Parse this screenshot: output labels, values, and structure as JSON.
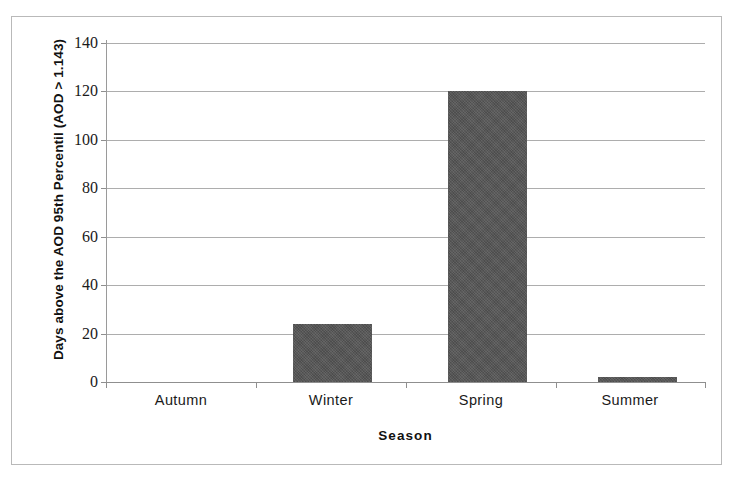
{
  "chart_data": {
    "type": "bar",
    "title": "",
    "subtitle": "",
    "xlabel": "Season",
    "ylabel": "Days above the AOD 95th Percentil (AOD > 1.143)",
    "categories": [
      "Autumn",
      "Winter",
      "Spring",
      "Summer"
    ],
    "values": [
      0,
      24,
      120,
      2
    ],
    "series": [
      {
        "name": "Days above the AOD 95th percentile",
        "values": [
          0,
          24,
          120,
          2
        ]
      }
    ],
    "ylim": [
      0,
      140
    ],
    "ytick_values": [
      0,
      20,
      40,
      60,
      80,
      100,
      120,
      140
    ],
    "ytick_labels": [
      "0",
      "20",
      "40",
      "60",
      "80",
      "100",
      "120",
      "140"
    ],
    "xtick_labels": [
      "Autumn",
      "Winter",
      "Spring",
      "Summer"
    ],
    "grid": true,
    "grid_axis": "y",
    "legend": false,
    "legend_position": "none",
    "bar_color": "#555555",
    "gridline_color": "#adadad",
    "axis_color": "#8f8f8f",
    "text_color": "#1a1a1a",
    "frame_color": "#b9b9b9",
    "background_color": "#ffffff",
    "annotations": []
  },
  "figure": {
    "border_visible": true
  }
}
